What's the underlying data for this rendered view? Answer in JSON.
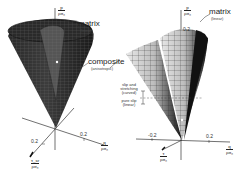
{
  "left_plot": {
    "axes": {
      "vertical": {
        "numerator": "p",
        "denominator": "ρσ₀"
      },
      "horizontal": {
        "numerator": "q",
        "denominator": "ρσ₀",
        "tick": "0.2"
      },
      "depth": {
        "numerator": "τ_sr",
        "denominator": "ρσ₀",
        "tick": "0.2"
      }
    },
    "labels": {
      "matrix": {
        "title": "matrix",
        "subtitle": "(linear)"
      },
      "composite": {
        "title": "composite",
        "subtitle": "(anisotropic)"
      }
    }
  },
  "right_plot": {
    "axes": {
      "vertical": {
        "numerator": "p",
        "denominator": "ρσ₀",
        "tick": "0.2"
      },
      "horizontal": {
        "numerator": "q",
        "denominator": "ρσ₀",
        "tick_neg": "-0.2",
        "tick_pos": "0.2"
      },
      "depth": {
        "numerator": "τ",
        "denominator": "ρσ₀"
      }
    },
    "labels": {
      "matrix": {
        "title": "matrix",
        "subtitle": "(linear)"
      },
      "slip_stretching": {
        "line1": "slip and",
        "line2": "stretching",
        "line3": "(curved)"
      },
      "pure_slip": {
        "line1": "pure slip",
        "line2": "(linear)"
      }
    }
  },
  "colors": {
    "surface_dark": "#1e1e1e",
    "surface_mid": "#777777",
    "surface_light": "#d8d8d8",
    "axis": "#333333"
  }
}
